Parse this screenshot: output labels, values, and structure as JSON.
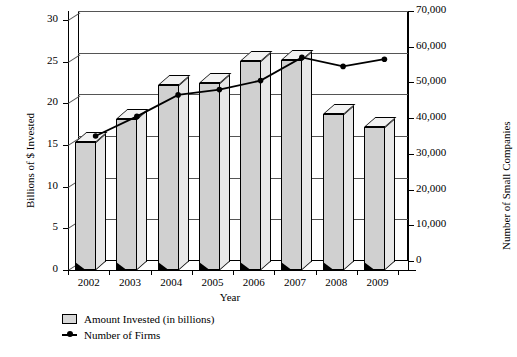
{
  "chart_data": {
    "type": "bar",
    "title": "",
    "xlabel": "Year",
    "ylabel": "Billions of $ Invested",
    "y2label": "Number of Small Companies",
    "categories": [
      "2002",
      "2003",
      "2004",
      "2005",
      "2006",
      "2007",
      "2008",
      "2009"
    ],
    "ylim": [
      0,
      30
    ],
    "y2lim": [
      0,
      70000
    ],
    "yticks": [
      "0",
      "5",
      "10",
      "15",
      "20",
      "25",
      "30"
    ],
    "ytick_values": [
      0,
      5,
      10,
      15,
      20,
      25,
      30
    ],
    "y2ticks": [
      "0",
      "10,000",
      "20,000",
      "30,000",
      "40,000",
      "50,000",
      "60,000",
      "70,000"
    ],
    "y2tick_values": [
      0,
      10000,
      20000,
      30000,
      40000,
      50000,
      60000,
      70000
    ],
    "grid": true,
    "legend_position": "bottom-left",
    "series": [
      {
        "name": "Amount Invested (in billions)",
        "type": "bar",
        "axis": "left",
        "color": "#d0d0d0",
        "values": [
          15.4,
          18.1,
          22.2,
          22.4,
          25.1,
          25.2,
          18.7,
          17.2
        ]
      },
      {
        "name": "Number of Firms",
        "type": "line",
        "axis": "right",
        "color": "#000000",
        "values": [
          35000,
          40500,
          46500,
          48000,
          50500,
          57000,
          54500,
          56500
        ]
      }
    ]
  },
  "legend": {
    "items": [
      {
        "label": "Amount Invested (in billions)",
        "marker": "square-swatch"
      },
      {
        "label": "Number of Firms",
        "marker": "line-dot"
      }
    ]
  }
}
